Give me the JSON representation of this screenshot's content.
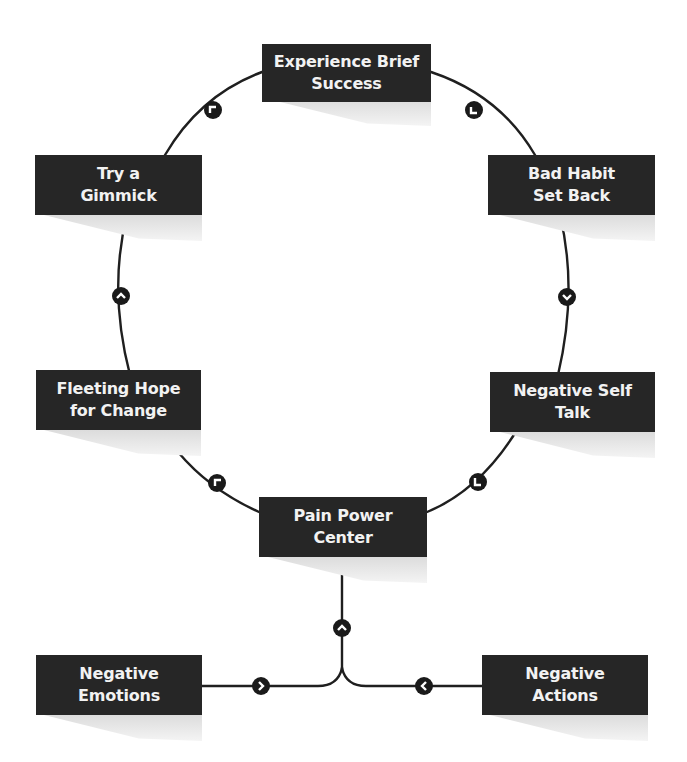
{
  "diagram": {
    "colors": {
      "node_fill": "#262626",
      "node_text": "#f2f2f2",
      "connector": "#1f1f1f",
      "shadow": "#dcdcdc",
      "background": "#ffffff"
    },
    "nodes": [
      {
        "id": "experience",
        "line1": "Experience Brief",
        "line2": "Success"
      },
      {
        "id": "bad-habit",
        "line1": "Bad Habit",
        "line2": "Set Back"
      },
      {
        "id": "negative-self-talk",
        "line1": "Negative Self",
        "line2": "Talk"
      },
      {
        "id": "pain-power-center",
        "line1": "Pain Power",
        "line2": "Center"
      },
      {
        "id": "fleeting-hope",
        "line1": "Fleeting Hope",
        "line2": "for Change"
      },
      {
        "id": "try-gimmick",
        "line1": "Try a",
        "line2": "Gimmick"
      },
      {
        "id": "negative-emotions",
        "line1": "Negative",
        "line2": "Emotions"
      },
      {
        "id": "negative-actions",
        "line1": "Negative",
        "line2": "Actions"
      }
    ],
    "edges": [
      {
        "from": "experience",
        "to": "bad-habit",
        "arrow": "arrow-down-right"
      },
      {
        "from": "bad-habit",
        "to": "negative-self-talk",
        "arrow": "arrow-down"
      },
      {
        "from": "negative-self-talk",
        "to": "pain-power-center",
        "arrow": "arrow-down-left"
      },
      {
        "from": "pain-power-center",
        "to": "fleeting-hope",
        "arrow": "arrow-up-left"
      },
      {
        "from": "fleeting-hope",
        "to": "try-gimmick",
        "arrow": "arrow-up"
      },
      {
        "from": "try-gimmick",
        "to": "experience",
        "arrow": "arrow-up-right"
      },
      {
        "from": "negative-emotions",
        "to": "pain-power-center",
        "arrow": "arrow-right"
      },
      {
        "from": "negative-actions",
        "to": "pain-power-center",
        "arrow": "arrow-left"
      },
      {
        "from": "merge",
        "to": "pain-power-center",
        "arrow": "arrow-up"
      }
    ]
  }
}
